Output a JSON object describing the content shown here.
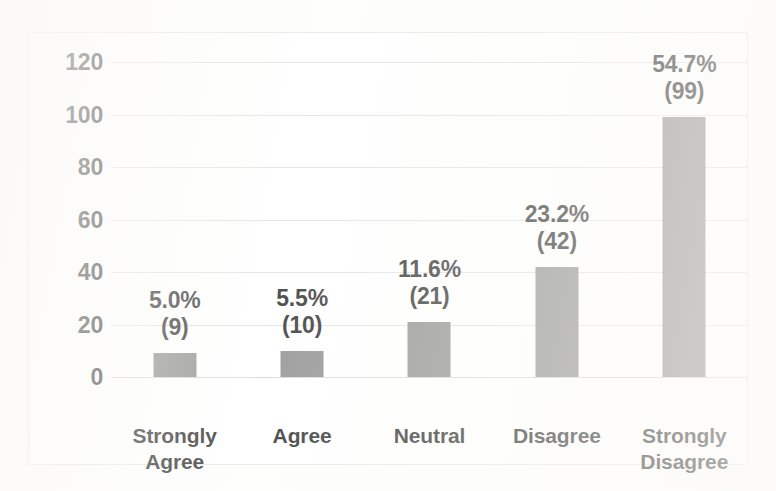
{
  "chart_data": {
    "type": "bar",
    "title": "",
    "subtitle": "",
    "xlabel": "",
    "ylabel": "",
    "categories": [
      "Strongly Agree",
      "Agree",
      "Neutral",
      "Disagree",
      "Strongly Disagree"
    ],
    "category_lines": [
      [
        "Strongly",
        "Agree"
      ],
      [
        "Agree"
      ],
      [
        "Neutral"
      ],
      [
        "Disagree"
      ],
      [
        "Strongly",
        "Disagree"
      ]
    ],
    "values": [
      9,
      10,
      21,
      42,
      99
    ],
    "percent_labels": [
      "5.0%",
      "5.5%",
      "11.6%",
      "23.2%",
      "54.7%"
    ],
    "count_labels": [
      "(9)",
      "(10)",
      "(21)",
      "(42)",
      "(99)"
    ],
    "percents": [
      5.0,
      5.5,
      11.6,
      23.2,
      54.7
    ],
    "ylim": [
      0,
      120
    ],
    "ytick_values": [
      120,
      100,
      80,
      60,
      40,
      20,
      0
    ],
    "ytick_labels": [
      "120",
      "100",
      "80",
      "60",
      "40",
      "20",
      "0"
    ],
    "grid": true,
    "grid_axis": "y",
    "legend": false,
    "legend_position": "none",
    "bar_color": "#808080",
    "grid_color": "#dedede",
    "text_color": "#151515",
    "plot_background": "#ffffff",
    "border_color": "#e3e3e1",
    "total_responses": 181
  }
}
